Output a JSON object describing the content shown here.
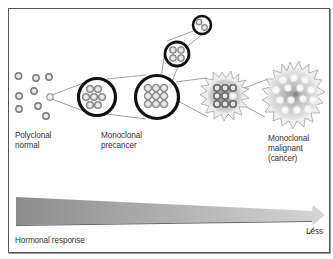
{
  "stages": [
    {
      "id": "polyclonal",
      "lines": [
        "Polyclonal",
        "normal"
      ]
    },
    {
      "id": "monoclonal-precancer",
      "lines": [
        "Monoclonal",
        "precancer"
      ]
    },
    {
      "id": "monoclonal-malignant",
      "lines": [
        "Monoclonal",
        "malignant",
        "(cancer)"
      ]
    }
  ],
  "axis": {
    "label": "Hormonal response",
    "end_label": "Less"
  },
  "colors": {
    "frame": "#555555",
    "cell_fill": "#e8e8e8",
    "cell_stroke": "#888888",
    "ring_stroke": "#111111",
    "arrow_dark": "#8a8a8a",
    "arrow_light": "#d8d8d8"
  }
}
